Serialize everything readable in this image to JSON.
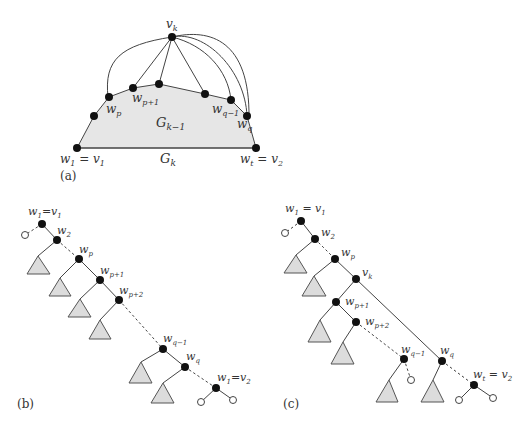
{
  "figure": {
    "panel_a": {
      "caption": "(a)",
      "top_vertex": "v",
      "top_vertex_sub": "k",
      "inner_region": "G",
      "inner_region_sub": "k−1",
      "outer_label": "G",
      "outer_label_sub": "k",
      "left_base": {
        "main": "w",
        "sub": "1",
        "eq": " = v",
        "sub2": "1"
      },
      "right_base": {
        "main": "w",
        "sub": "t",
        "eq": " = v",
        "sub2": "2"
      },
      "wp": {
        "main": "w",
        "sub": "p"
      },
      "wp1": {
        "main": "w",
        "sub": "p+1"
      },
      "wq1": {
        "main": "w",
        "sub": "q−1"
      },
      "wq": {
        "main": "w",
        "sub": "q"
      }
    },
    "panel_b": {
      "caption": "(b)",
      "root": {
        "main": "w",
        "sub": "1",
        "eq": "=v",
        "sub2": "1"
      },
      "w2": {
        "main": "w",
        "sub": "2"
      },
      "wp": {
        "main": "w",
        "sub": "p"
      },
      "wp1": {
        "main": "w",
        "sub": "p+1"
      },
      "wp2": {
        "main": "w",
        "sub": "p+2"
      },
      "wq1": {
        "main": "w",
        "sub": "q−1"
      },
      "wq": {
        "main": "w",
        "sub": "q"
      },
      "end": {
        "main": "w",
        "sub": "1",
        "eq": "=v",
        "sub2": "2"
      }
    },
    "panel_c": {
      "caption": "(c)",
      "root": {
        "main": "w",
        "sub": "1",
        "eq": " = v",
        "sub2": "1"
      },
      "w2": {
        "main": "w",
        "sub": "2"
      },
      "wp": {
        "main": "w",
        "sub": "p"
      },
      "vk": {
        "main": "v",
        "sub": "k"
      },
      "wp1": {
        "main": "w",
        "sub": "p+1"
      },
      "wp2": {
        "main": "w",
        "sub": "p+2"
      },
      "wq1": {
        "main": "w",
        "sub": "q−1"
      },
      "wq": {
        "main": "w",
        "sub": "q"
      },
      "end": {
        "main": "w",
        "sub": "t",
        "eq": " = v",
        "sub2": "2"
      }
    }
  }
}
